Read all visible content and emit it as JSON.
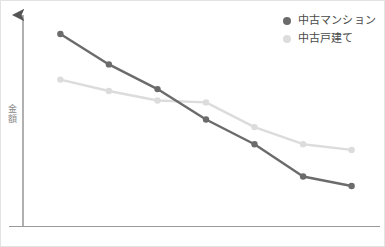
{
  "chart_data": {
    "type": "line",
    "title": "",
    "xlabel": "",
    "ylabel": "金額",
    "grid": false,
    "legend_position": "top-right",
    "x": [
      1,
      2,
      3,
      4,
      5,
      6,
      7
    ],
    "xlim": [
      0.6,
      7.4
    ],
    "ylim": [
      0,
      100
    ],
    "series": [
      {
        "name": "中古マンション",
        "color": "#6b6b6b",
        "values": [
          96,
          80,
          67,
          51,
          38,
          21,
          16
        ]
      },
      {
        "name": "中古戸建て",
        "color": "#dcdcdc",
        "values": [
          72,
          66,
          61,
          60,
          47,
          38,
          35
        ]
      }
    ]
  },
  "axis": {
    "y_label": "金額",
    "y_arrow": "up-arrow",
    "color": "#9a9a9a"
  },
  "legend": {
    "items": [
      {
        "label": "中古マンション",
        "color": "#6b6b6b"
      },
      {
        "label": "中古戸建て",
        "color": "#dcdcdc"
      }
    ]
  }
}
